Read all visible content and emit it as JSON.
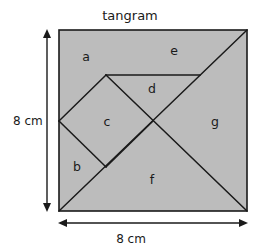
{
  "figure": {
    "title": "tangram",
    "shape_name": "square",
    "fill_color": "#bcbcbc",
    "line_color": "#1a1a1a",
    "background_color": "#ffffff"
  },
  "dimensions": {
    "left_label": "8 cm",
    "bottom_label": "8 cm",
    "side_length_value": 8,
    "units": "cm"
  },
  "pieces": [
    {
      "id": "a",
      "label": "a",
      "x": 86,
      "y": 57
    },
    {
      "id": "b",
      "label": "b",
      "x": 77,
      "y": 167
    },
    {
      "id": "c",
      "label": "c",
      "x": 107,
      "y": 122
    },
    {
      "id": "d",
      "label": "d",
      "x": 152,
      "y": 89
    },
    {
      "id": "e",
      "label": "e",
      "x": 174,
      "y": 51
    },
    {
      "id": "f",
      "label": "f",
      "x": 152,
      "y": 180
    },
    {
      "id": "g",
      "label": "g",
      "x": 215,
      "y": 122
    }
  ],
  "geometry": {
    "square": {
      "left": 59,
      "top": 30,
      "right": 247,
      "bottom": 211
    },
    "vertices": {
      "top_left": "59,30",
      "top_right": "247,30",
      "bottom_left": "59,211",
      "bottom_right": "247,211",
      "center": "153,121",
      "left_mid": "59,121",
      "top_mid": "153,30",
      "upper_left_quarter": "106,75",
      "lower_left_quarter": "106,167",
      "right_upper_quarter": "200,75"
    },
    "cut_lines": [
      "59,211 247,30",
      "247,211 106,75",
      "106,75 200,75",
      "59,121 106,167"
    ]
  }
}
